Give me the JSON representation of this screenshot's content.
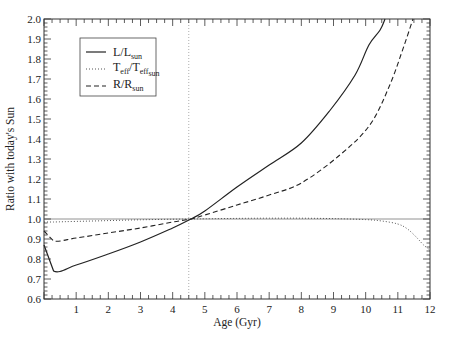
{
  "chart_data": {
    "type": "line",
    "title": "",
    "xlabel": "Age (Gyr)",
    "ylabel": "Ratio with today's Sun",
    "xlim": [
      0,
      12
    ],
    "ylim": [
      0.6,
      2.0
    ],
    "x_ticks": [
      1,
      2,
      3,
      4,
      5,
      6,
      7,
      8,
      9,
      10,
      11,
      12
    ],
    "y_ticks": [
      "0.6",
      "0.7",
      "0.8",
      "0.9",
      "1.0",
      "1.1",
      "1.2",
      "1.3",
      "1.4",
      "1.5",
      "1.6",
      "1.7",
      "1.8",
      "1.9",
      "2.0"
    ],
    "grid": false,
    "legend_position": "upper left",
    "reference_lines": {
      "horizontal_y": 1.0,
      "vertical_x": 4.5
    },
    "series": [
      {
        "name": "L/L_sun",
        "label_main": "L/L",
        "label_sub": "sun",
        "style": "solid",
        "x": [
          0.0,
          0.3,
          1.0,
          2.0,
          3.0,
          4.0,
          4.57,
          5.0,
          6.0,
          7.0,
          8.0,
          8.9,
          9.67,
          10.1,
          10.45,
          10.6
        ],
        "values": [
          0.87,
          0.74,
          0.77,
          0.825,
          0.885,
          0.955,
          1.0,
          1.04,
          1.16,
          1.27,
          1.38,
          1.545,
          1.72,
          1.87,
          1.945,
          2.0
        ]
      },
      {
        "name": "T_eff/T_eff_sun",
        "label_main": "T",
        "label_sub1": "eff",
        "label_mid": "/T",
        "label_sub2": "eff",
        "label_sub3": "sun",
        "style": "dotted",
        "x": [
          0.0,
          0.3,
          1.0,
          2.0,
          3.0,
          4.0,
          4.57,
          5.0,
          6.0,
          7.0,
          8.0,
          9.0,
          10.0,
          10.5,
          11.0,
          11.3,
          11.6,
          11.8,
          12.0
        ],
        "values": [
          0.985,
          0.985,
          0.988,
          0.992,
          0.996,
          0.999,
          1.0,
          1.001,
          1.003,
          1.004,
          1.004,
          1.002,
          0.997,
          0.99,
          0.975,
          0.95,
          0.905,
          0.87,
          0.845
        ]
      },
      {
        "name": "R/R_sun",
        "label_main": "R/R",
        "label_sub": "sun",
        "style": "dashed",
        "x": [
          0.0,
          0.3,
          1.0,
          2.0,
          3.0,
          4.0,
          4.57,
          5.0,
          6.0,
          7.0,
          8.0,
          9.2,
          10.13,
          10.75,
          11.2,
          11.47
        ],
        "values": [
          0.94,
          0.89,
          0.905,
          0.93,
          0.955,
          0.985,
          1.0,
          1.02,
          1.07,
          1.12,
          1.18,
          1.32,
          1.47,
          1.67,
          1.87,
          2.0
        ]
      }
    ]
  }
}
